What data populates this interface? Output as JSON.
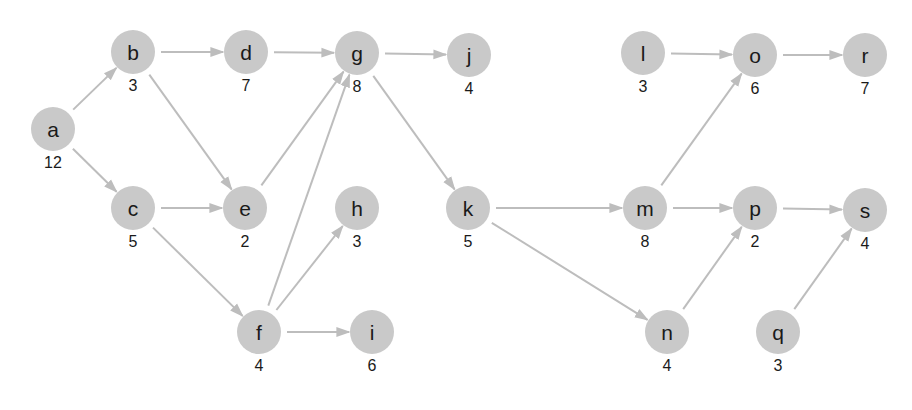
{
  "diagram": {
    "type": "directed-acyclic-graph",
    "colors": {
      "node_fill": "#c9c9c9",
      "edge": "#bdbdbd",
      "text": "#1a1a1a",
      "background": "#ffffff"
    },
    "node_radius": 22,
    "nodes": [
      {
        "id": "a",
        "label": "a",
        "weight": "12",
        "x": 53,
        "y": 129
      },
      {
        "id": "b",
        "label": "b",
        "weight": "3",
        "x": 133,
        "y": 52
      },
      {
        "id": "c",
        "label": "c",
        "weight": "5",
        "x": 133,
        "y": 208
      },
      {
        "id": "d",
        "label": "d",
        "weight": "7",
        "x": 246,
        "y": 52
      },
      {
        "id": "e",
        "label": "e",
        "weight": "2",
        "x": 245,
        "y": 208
      },
      {
        "id": "f",
        "label": "f",
        "weight": "4",
        "x": 259,
        "y": 332
      },
      {
        "id": "g",
        "label": "g",
        "weight": "8",
        "x": 357,
        "y": 53
      },
      {
        "id": "h",
        "label": "h",
        "weight": "3",
        "x": 357,
        "y": 208
      },
      {
        "id": "i",
        "label": "i",
        "weight": "6",
        "x": 372,
        "y": 332
      },
      {
        "id": "j",
        "label": "j",
        "weight": "4",
        "x": 469,
        "y": 55
      },
      {
        "id": "k",
        "label": "k",
        "weight": "5",
        "x": 468,
        "y": 208
      },
      {
        "id": "l",
        "label": "l",
        "weight": "3",
        "x": 643,
        "y": 53
      },
      {
        "id": "m",
        "label": "m",
        "weight": "8",
        "x": 645,
        "y": 208
      },
      {
        "id": "n",
        "label": "n",
        "weight": "4",
        "x": 667,
        "y": 332
      },
      {
        "id": "o",
        "label": "o",
        "weight": "6",
        "x": 755,
        "y": 55
      },
      {
        "id": "p",
        "label": "p",
        "weight": "2",
        "x": 755,
        "y": 208
      },
      {
        "id": "q",
        "label": "q",
        "weight": "3",
        "x": 778,
        "y": 332
      },
      {
        "id": "r",
        "label": "r",
        "weight": "7",
        "x": 865,
        "y": 55
      },
      {
        "id": "s",
        "label": "s",
        "weight": "4",
        "x": 865,
        "y": 210
      }
    ],
    "edges": [
      {
        "from": "a",
        "to": "b"
      },
      {
        "from": "a",
        "to": "c"
      },
      {
        "from": "b",
        "to": "d"
      },
      {
        "from": "b",
        "to": "e"
      },
      {
        "from": "c",
        "to": "e"
      },
      {
        "from": "c",
        "to": "f"
      },
      {
        "from": "d",
        "to": "g"
      },
      {
        "from": "e",
        "to": "g"
      },
      {
        "from": "f",
        "to": "g"
      },
      {
        "from": "f",
        "to": "h"
      },
      {
        "from": "f",
        "to": "i"
      },
      {
        "from": "g",
        "to": "j"
      },
      {
        "from": "g",
        "to": "k"
      },
      {
        "from": "k",
        "to": "m"
      },
      {
        "from": "k",
        "to": "n"
      },
      {
        "from": "l",
        "to": "o"
      },
      {
        "from": "m",
        "to": "o"
      },
      {
        "from": "m",
        "to": "p"
      },
      {
        "from": "n",
        "to": "p"
      },
      {
        "from": "o",
        "to": "r"
      },
      {
        "from": "p",
        "to": "s"
      },
      {
        "from": "q",
        "to": "s"
      }
    ]
  }
}
